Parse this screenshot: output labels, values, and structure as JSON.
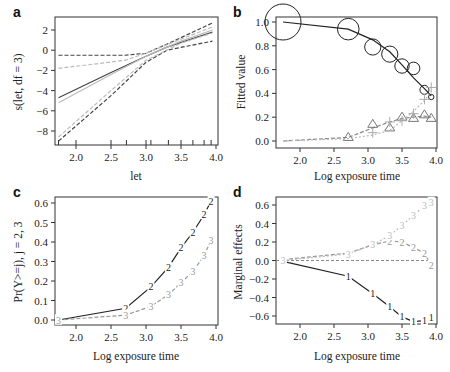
{
  "chart_data": [
    {
      "panel": "a",
      "type": "line",
      "xlabel": "let",
      "ylabel": "s(let, df = 3)",
      "xlim": [
        1.75,
        4.0
      ],
      "ylim": [
        -9,
        3
      ],
      "xticks": [
        "2.0",
        "2.5",
        "3.0",
        "3.5",
        "4.0"
      ],
      "yticks": [
        "2",
        "0",
        "-2",
        "-4",
        "-6",
        "-8"
      ],
      "rug": [
        1.75,
        2.0,
        2.5,
        2.72,
        3.0,
        3.07,
        3.32,
        3.5,
        3.67,
        3.83,
        3.93
      ],
      "series": [
        {
          "name": "smooth fit",
          "style": "solid",
          "color": "#444444",
          "x": [
            1.75,
            2.5,
            3.0,
            3.3,
            3.95
          ],
          "y": [
            -4.7,
            -2.2,
            -0.6,
            0.3,
            1.8
          ]
        },
        {
          "name": "upper band",
          "style": "dashed",
          "color": "#444444",
          "x": [
            1.75,
            2.7,
            3.0,
            3.3,
            3.95
          ],
          "y": [
            -0.5,
            -0.5,
            -0.3,
            0.6,
            2.7
          ]
        },
        {
          "name": "lower band",
          "style": "dashed",
          "color": "#444444",
          "x": [
            1.75,
            2.5,
            3.0,
            3.3,
            3.95
          ],
          "y": [
            -9.0,
            -4.5,
            -1.2,
            0.0,
            0.9
          ]
        },
        {
          "name": "linear fit",
          "style": "solid",
          "color": "#bbbbbb",
          "x": [
            1.75,
            2.5,
            3.0,
            3.5,
            3.95
          ],
          "y": [
            -5.2,
            -2.4,
            -0.6,
            0.9,
            2.0
          ]
        },
        {
          "name": "linear upper",
          "style": "dashed",
          "color": "#bbbbbb",
          "x": [
            1.75,
            2.7,
            3.0,
            3.5,
            3.95
          ],
          "y": [
            -1.8,
            -1.0,
            -0.3,
            1.1,
            2.3
          ]
        },
        {
          "name": "linear lower",
          "style": "dashed",
          "color": "#bbbbbb",
          "x": [
            1.75,
            2.5,
            3.0,
            3.5,
            3.95
          ],
          "y": [
            -8.6,
            -4.0,
            -1.0,
            0.7,
            1.7
          ]
        }
      ]
    },
    {
      "panel": "b",
      "type": "scatter",
      "xlabel": "Log exposure time",
      "ylabel": "Fitted value",
      "xlim": [
        1.75,
        4.0
      ],
      "ylim": [
        -0.05,
        1.05
      ],
      "xticks": [
        "2.0",
        "2.5",
        "3.0",
        "3.5",
        "4.0"
      ],
      "yticks": [
        "1.0",
        "0.8",
        "0.6",
        "0.4",
        "0.2",
        "0.0"
      ],
      "series": [
        {
          "name": "Y=1 fitted",
          "style": "solid",
          "color": "#222222",
          "x": [
            1.75,
            2.71,
            3.07,
            3.32,
            3.5,
            3.67,
            3.83,
            3.93
          ],
          "y": [
            1.0,
            0.94,
            0.85,
            0.75,
            0.64,
            0.53,
            0.44,
            0.38
          ]
        },
        {
          "name": "Y=1 observed (circles)",
          "marker": "circle",
          "color": "#222222",
          "x": [
            1.75,
            2.71,
            3.07,
            3.32,
            3.5,
            3.67,
            3.83,
            3.93
          ],
          "y": [
            1.0,
            0.94,
            0.79,
            0.73,
            0.63,
            0.61,
            0.43,
            0.37
          ],
          "size": [
            20,
            12,
            9,
            9,
            8,
            7,
            5,
            3
          ]
        },
        {
          "name": "Y=2 fitted",
          "style": "dashed",
          "color": "#888888",
          "x": [
            1.75,
            2.71,
            3.07,
            3.32,
            3.5,
            3.67,
            3.83,
            3.93
          ],
          "y": [
            0.0,
            0.03,
            0.11,
            0.16,
            0.19,
            0.2,
            0.21,
            0.2
          ]
        },
        {
          "name": "Y=2 observed (triangles)",
          "marker": "triangle",
          "color": "#777777",
          "x": [
            2.71,
            3.07,
            3.32,
            3.5,
            3.67,
            3.83,
            3.93
          ],
          "y": [
            0.03,
            0.14,
            0.11,
            0.2,
            0.19,
            0.22,
            0.19
          ]
        },
        {
          "name": "Y=3 fitted",
          "style": "dotted",
          "color": "#bbbbbb",
          "x": [
            1.75,
            2.71,
            3.07,
            3.32,
            3.5,
            3.67,
            3.83,
            3.93
          ],
          "y": [
            0.0,
            0.02,
            0.05,
            0.09,
            0.17,
            0.25,
            0.34,
            0.42
          ]
        },
        {
          "name": "Y=3 observed (plus)",
          "marker": "plus",
          "color": "#aaaaaa",
          "x": [
            3.07,
            3.32,
            3.5,
            3.67,
            3.83,
            3.93
          ],
          "y": [
            0.07,
            0.16,
            0.17,
            0.23,
            0.35,
            0.45
          ]
        }
      ]
    },
    {
      "panel": "c",
      "type": "line",
      "xlabel": "Log exposure time",
      "ylabel": "Pr(Y>=j),  j = 2, 3",
      "xlim": [
        1.75,
        4.0
      ],
      "ylim": [
        -0.02,
        0.62
      ],
      "xticks": [
        "2.0",
        "2.5",
        "3.0",
        "3.5",
        "4.0"
      ],
      "yticks": [
        "0.6",
        "0.5",
        "0.4",
        "0.3",
        "0.2",
        "0.1",
        "0.0"
      ],
      "series": [
        {
          "name": "2",
          "style": "solid",
          "color": "#222222",
          "label": "2",
          "x": [
            1.75,
            2.71,
            3.07,
            3.32,
            3.5,
            3.67,
            3.83,
            3.93
          ],
          "y": [
            0.0,
            0.06,
            0.17,
            0.27,
            0.37,
            0.45,
            0.54,
            0.61
          ]
        },
        {
          "name": "3",
          "style": "dashed",
          "color": "#999999",
          "label": "3",
          "x": [
            1.75,
            2.71,
            3.07,
            3.32,
            3.5,
            3.67,
            3.83,
            3.93
          ],
          "y": [
            0.0,
            0.025,
            0.07,
            0.13,
            0.19,
            0.25,
            0.33,
            0.41
          ]
        }
      ]
    },
    {
      "panel": "d",
      "type": "line",
      "xlabel": "Log exposure time",
      "ylabel": "Marginal effects",
      "xlim": [
        1.75,
        4.0
      ],
      "ylim": [
        -0.7,
        0.68
      ],
      "xticks": [
        "2.0",
        "2.5",
        "3.0",
        "3.5",
        "4.0"
      ],
      "yticks": [
        "0.6",
        "0.4",
        "0.2",
        "0.0",
        "-0.2",
        "-0.4",
        "-0.6"
      ],
      "hline": 0,
      "series": [
        {
          "name": "1",
          "style": "solid",
          "color": "#222222",
          "label": "1",
          "x": [
            1.75,
            2.71,
            3.07,
            3.32,
            3.5,
            3.67,
            3.83,
            3.93
          ],
          "y": [
            -0.01,
            -0.17,
            -0.36,
            -0.5,
            -0.61,
            -0.66,
            -0.65,
            -0.62
          ]
        },
        {
          "name": "2",
          "style": "dashed",
          "color": "#999999",
          "label": "2",
          "x": [
            1.75,
            2.71,
            3.07,
            3.32,
            3.5,
            3.67,
            3.83,
            3.93
          ],
          "y": [
            0.01,
            0.08,
            0.17,
            0.21,
            0.2,
            0.14,
            0.08,
            -0.05
          ]
        },
        {
          "name": "3",
          "style": "dotted",
          "color": "#bbbbbb",
          "label": "3",
          "x": [
            1.75,
            2.71,
            3.07,
            3.32,
            3.5,
            3.67,
            3.83,
            3.93
          ],
          "y": [
            0.0,
            0.07,
            0.17,
            0.27,
            0.38,
            0.49,
            0.59,
            0.63
          ]
        }
      ]
    }
  ],
  "panels": {
    "a": {
      "letter": "a",
      "xlabel": "let",
      "ylabel": "s(let, df = 3)"
    },
    "b": {
      "letter": "b",
      "xlabel": "Log exposure time",
      "ylabel": "Fitted value"
    },
    "c": {
      "letter": "c",
      "xlabel": "Log exposure time",
      "ylabel": "Pr(Y>=j),  j = 2, 3"
    },
    "d": {
      "letter": "d",
      "xlabel": "Log exposure time",
      "ylabel": "Marginal effects"
    }
  }
}
